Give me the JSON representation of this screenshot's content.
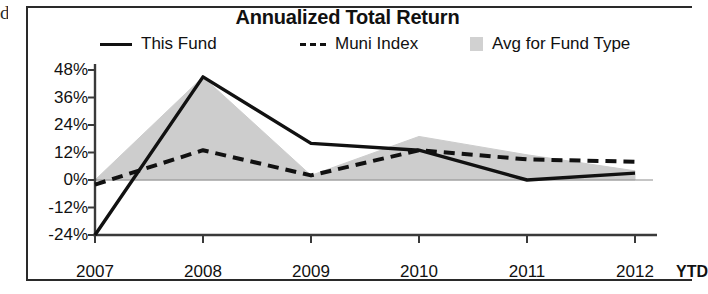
{
  "edge_fragment": "d",
  "chart_title": "Annualized Total Return",
  "legend": [
    {
      "label": "This Fund",
      "marker": "solid-line-swatch"
    },
    {
      "label": "Muni Index",
      "marker": "dashed-line-swatch"
    },
    {
      "label": "Avg for Fund Type",
      "marker": "gray-area-swatch"
    }
  ],
  "axis": {
    "ytd_note": "YTD"
  },
  "chart_data": {
    "type": "line",
    "title": "Annualized Total Return",
    "xlabel": "",
    "ylabel": "",
    "categories": [
      "2007",
      "2008",
      "2009",
      "2010",
      "2011",
      "2012"
    ],
    "x_tick_labels": [
      "2007",
      "2008",
      "2009",
      "2010",
      "2011",
      "2012"
    ],
    "y_tick_labels": [
      "48%",
      "36%",
      "24%",
      "12%",
      "0%",
      "-12%",
      "-24%"
    ],
    "y_ticks": [
      48,
      36,
      24,
      12,
      0,
      -12,
      -24
    ],
    "ylim": [
      -24,
      48
    ],
    "grid": false,
    "legend_position": "top",
    "annotations": [
      "YTD"
    ],
    "series": [
      {
        "name": "This Fund",
        "style": "solid",
        "color": "#111111",
        "values": [
          -24,
          45,
          16,
          13,
          0,
          3
        ]
      },
      {
        "name": "Muni Index",
        "style": "dashed",
        "color": "#111111",
        "values": [
          -2,
          13,
          2,
          13,
          9,
          8
        ]
      },
      {
        "name": "Avg for Fund Type",
        "style": "filled-area",
        "color": "#c9c9c9",
        "values": [
          0,
          45,
          2,
          19,
          11,
          4
        ]
      }
    ]
  }
}
